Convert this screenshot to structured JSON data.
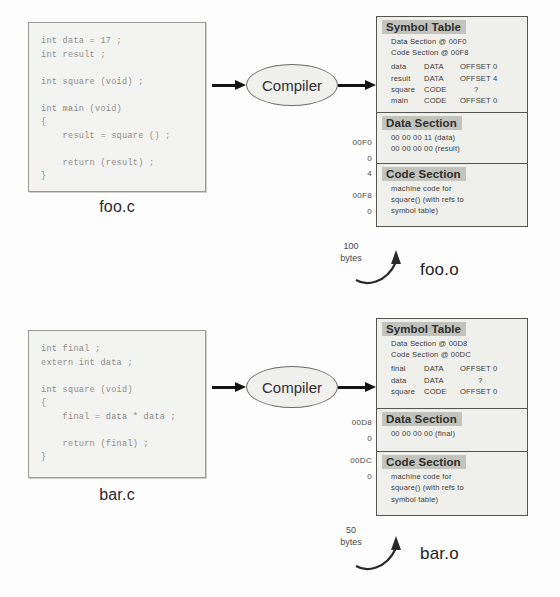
{
  "diagram": {
    "compiler_label": "Compiler",
    "icons": {
      "arrow_right": "arrow-right-icon",
      "curved_arrow": "curved-arrow-icon"
    }
  },
  "units": {
    "foo": {
      "source": {
        "name": "foo.c",
        "code": "int data = 17 ;\nint result ;\n\nint square (void) ;\n\nint main (void)\n{\n    result = square () ;\n\n    return (result) ;\n}"
      },
      "object": {
        "name": "foo.o",
        "size_value": "100",
        "size_unit": "bytes",
        "symbol_table": {
          "title": "Symbol Table",
          "data_section_line": "Data Section @ 00F0",
          "code_section_line": "Code Section @ 00F8",
          "rows": [
            {
              "name": "data",
              "kind": "DATA",
              "offset": "OFFSET 0"
            },
            {
              "name": "result",
              "kind": "DATA",
              "offset": "OFFSET 4"
            },
            {
              "name": "square",
              "kind": "CODE",
              "offset": "?"
            },
            {
              "name": "main",
              "kind": "CODE",
              "offset": "OFFSET 0"
            }
          ]
        },
        "data_section": {
          "title": "Data Section",
          "lines": [
            "00 00 00 11 (data)",
            "00 00 00 00 (result)"
          ],
          "addresses": [
            "00F0",
            "0",
            "4"
          ]
        },
        "code_section": {
          "title": "Code Section",
          "lines": [
            "machine code for",
            "square() (with refs to",
            "symbol table)"
          ],
          "addresses": [
            "00F8",
            "0"
          ]
        }
      }
    },
    "bar": {
      "source": {
        "name": "bar.c",
        "code": "int final ;\nextern int data ;\n\nint square (void)\n{\n    final = data * data ;\n\n    return (final) ;\n}"
      },
      "object": {
        "name": "bar.o",
        "size_value": "50",
        "size_unit": "bytes",
        "symbol_table": {
          "title": "Symbol Table",
          "data_section_line": "Data Section @ 00D8",
          "code_section_line": "Code Section @ 00DC",
          "rows": [
            {
              "name": "final",
              "kind": "DATA",
              "offset": "OFFSET 0"
            },
            {
              "name": "data",
              "kind": "DATA",
              "offset": "?"
            },
            {
              "name": "square",
              "kind": "CODE",
              "offset": "OFFSET 0"
            }
          ]
        },
        "data_section": {
          "title": "Data Section",
          "lines": [
            "00 00 00 00 (final)"
          ],
          "addresses": [
            "00D8",
            "0"
          ]
        },
        "code_section": {
          "title": "Code Section",
          "lines": [
            "machine code for",
            "square() (with refs to",
            "symbol table)"
          ],
          "addresses": [
            "00DC",
            "0"
          ]
        }
      }
    }
  },
  "colors": {
    "page_bg": "#fdfdfd",
    "source_fill": "#f3f3f1",
    "object_fill": "#efefec",
    "section_header_fill": "#c3c3bd",
    "stroke": "#55554f",
    "arrow": "#141414"
  }
}
